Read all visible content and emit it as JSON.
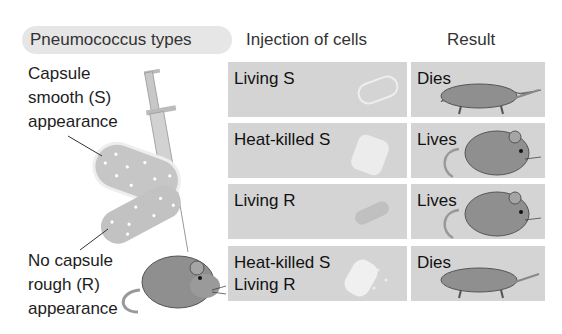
{
  "headers": {
    "types": "Pneumococcus types",
    "injection": "Injection of cells",
    "result": "Result"
  },
  "labels": {
    "s_type": [
      "Capsule",
      "smooth (S)",
      "appearance"
    ],
    "r_type": [
      "No capsule",
      "rough (R)",
      "appearance"
    ]
  },
  "rows": [
    {
      "injection": "Living S",
      "result": "Dies",
      "mouse": "dead-mouse-icon",
      "cell": "living-s-cell-icon"
    },
    {
      "injection": "Heat-killed S",
      "result": "Lives",
      "mouse": "live-mouse-icon",
      "cell": "heat-killed-s-cell-icon"
    },
    {
      "injection": "Living R",
      "result": "Lives",
      "mouse": "live-mouse-icon",
      "cell": "living-r-cell-icon"
    },
    {
      "injection": "Heat-killed S\nLiving R",
      "result": "Dies",
      "mouse": "dead-mouse-icon",
      "cell": "mixed-cells-icon"
    }
  ],
  "colors": {
    "cell_bg": "#d4d4d4",
    "pill_bg": "#e6e6e6",
    "mouse": "#8f8f8f",
    "bacteria": "#bdbdbd"
  }
}
